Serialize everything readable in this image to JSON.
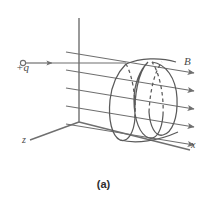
{
  "figure": {
    "caption": "(a)",
    "background_color": "#ffffff",
    "line_color": "#6f6f6f",
    "helix_color": "#5a5a5a",
    "label_color": "#4a4a4a"
  },
  "axes": {
    "origin": {
      "x": 79,
      "y": 122
    },
    "y_axis": {
      "label": "",
      "tip": {
        "x": 79,
        "y": 18
      }
    },
    "x_axis": {
      "label": "x",
      "tip": {
        "x": 190,
        "y": 150
      }
    },
    "z_axis": {
      "label": "z",
      "tip": {
        "x": 30,
        "y": 140
      }
    }
  },
  "charge": {
    "label": "+q",
    "sign": "positive",
    "marker": "open-circle",
    "entry_point": {
      "x": 23,
      "y": 63
    },
    "velocity_arrow_tip": {
      "x": 52,
      "y": 63
    },
    "path_end": {
      "x": 125,
      "y": 63
    }
  },
  "field": {
    "label": "B",
    "direction": "+x",
    "line_count": 5,
    "lines": [
      {
        "x1": 66,
        "y1": 52,
        "x2": 196,
        "y2": 74
      },
      {
        "x1": 66,
        "y1": 70,
        "x2": 196,
        "y2": 92
      },
      {
        "x1": 66,
        "y1": 88,
        "x2": 196,
        "y2": 110
      },
      {
        "x1": 66,
        "y1": 106,
        "x2": 196,
        "y2": 128
      },
      {
        "x1": 66,
        "y1": 124,
        "x2": 196,
        "y2": 146
      }
    ],
    "arrowheads": "right-end-of-each-line"
  },
  "trajectory": {
    "type": "helix",
    "loop_count": 3,
    "axis_direction": "+x",
    "start": {
      "x": 125,
      "y": 63
    },
    "loops": [
      {
        "cx": 113,
        "cy": 101,
        "rx": 14,
        "ry": 39,
        "tilt": -12
      },
      {
        "cx": 139,
        "cy": 96,
        "rx": 14,
        "ry": 39,
        "tilt": -12
      },
      {
        "cx": 165,
        "cy": 91,
        "rx": 14,
        "ry": 39,
        "tilt": -12
      }
    ],
    "hidden_segments": "dashed"
  },
  "labels": {
    "charge": "+q",
    "field": "B",
    "axis_x": "x",
    "axis_z": "z",
    "caption": "(a)"
  }
}
